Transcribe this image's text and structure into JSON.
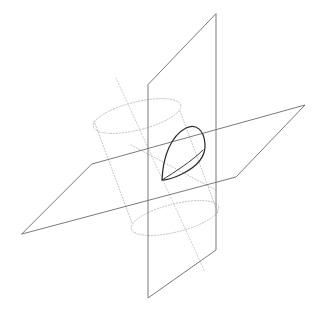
{
  "figure": {
    "canvas": {
      "width": 321,
      "height": 316
    },
    "colors": {
      "background": "#ffffff",
      "solid_edge": "#6b6b6b",
      "hidden_edge": "#b9b9bd",
      "axis_line": "#c2c2c6",
      "curve": "#2c2c2c"
    },
    "elements": [
      {
        "name": "vertical-plane",
        "kind": "plane",
        "style": "solid",
        "vertices": [
          [
            216,
            14
          ],
          [
            216,
            250
          ],
          [
            148,
            298
          ],
          [
            148,
            85
          ]
        ]
      },
      {
        "name": "horizontal-plane",
        "kind": "plane",
        "style": "solid",
        "vertices": [
          [
            92,
            164
          ],
          [
            305,
            105
          ],
          [
            236,
            177
          ],
          [
            22,
            234
          ]
        ]
      },
      {
        "name": "cylinder-top-ellipse",
        "kind": "ellipse",
        "style": "dotted",
        "center": [
          137,
          116
        ],
        "rx": 45,
        "ry": 14,
        "rotation_deg": -14
      },
      {
        "name": "cylinder-bottom-ellipse",
        "kind": "ellipse",
        "style": "dotted",
        "center": [
          175,
          218
        ],
        "rx": 45,
        "ry": 14,
        "rotation_deg": -14
      },
      {
        "name": "cylinder-left-side",
        "kind": "line",
        "style": "dotted",
        "from": [
          94,
          124
        ],
        "to": [
          132,
          226
        ]
      },
      {
        "name": "cylinder-right-side",
        "kind": "line",
        "style": "dotted",
        "from": [
          180,
          108
        ],
        "to": [
          218,
          210
        ]
      },
      {
        "name": "cylinder-axis",
        "kind": "line",
        "style": "dotted",
        "from": [
          116,
          78
        ],
        "to": [
          205,
          272
        ]
      },
      {
        "name": "intersection-curve-loop",
        "kind": "closed-curve",
        "style": "solid",
        "apex": [
          188,
          128
        ],
        "tip": [
          162,
          180
        ],
        "right": [
          205,
          155
        ]
      },
      {
        "name": "intersection-curve-chord",
        "kind": "curve",
        "style": "solid",
        "from": [
          162,
          180
        ],
        "to": [
          203,
          150
        ]
      }
    ]
  }
}
